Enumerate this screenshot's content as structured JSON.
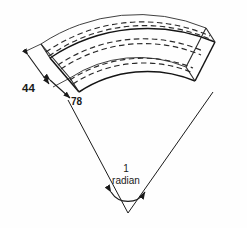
{
  "figure": {
    "background_color": "#fefefe",
    "line_color": "#1a1a1a",
    "dimensions": {
      "width_label": "44",
      "thickness_label": "78",
      "angle_label_value": "1",
      "angle_label_unit": "radian"
    },
    "annotations": {
      "angle_full": "1 radian"
    },
    "geometry": {
      "apex_x": 128,
      "apex_y": 213,
      "sector_half_angle_deg": 28.6,
      "radius_outer": 176,
      "radius_inner": 124,
      "depth_offset_x": -9,
      "depth_offset_y": -14
    }
  }
}
